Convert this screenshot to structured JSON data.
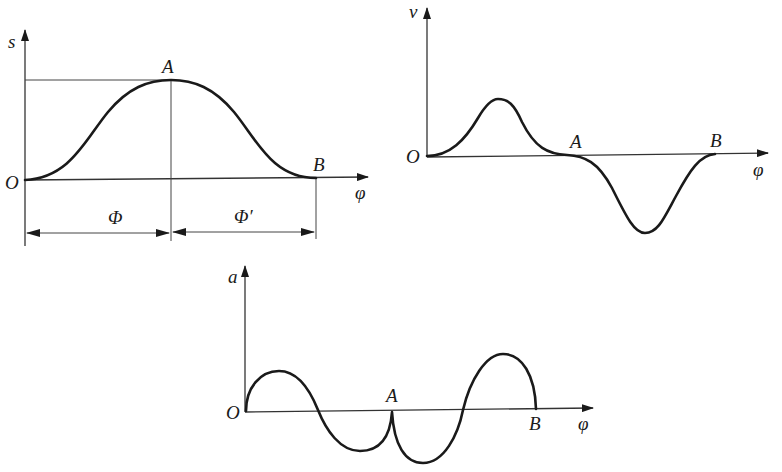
{
  "figure": {
    "colors": {
      "stroke": "#1a1a1a",
      "background": "#ffffff"
    }
  },
  "displacement_graph": {
    "y_label": "s",
    "x_label": "φ",
    "origin_label": "O",
    "point_a_label": "A",
    "point_b_label": "B",
    "rise_angle_label": "Φ",
    "return_angle_label": "Φ′"
  },
  "velocity_graph": {
    "y_label": "v",
    "x_label": "φ",
    "origin_label": "O",
    "point_a_label": "A",
    "point_b_label": "B"
  },
  "acceleration_graph": {
    "y_label": "a",
    "x_label": "φ",
    "origin_label": "O",
    "point_a_label": "A",
    "point_b_label": "B"
  }
}
